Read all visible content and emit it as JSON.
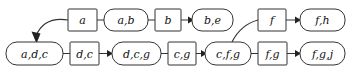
{
  "diagram": {
    "kind": "state-transition-graph",
    "colors": {
      "background": "#ffffff",
      "stroke": "#333333",
      "text": "#111111",
      "arrow": "#222222"
    },
    "nodes": [
      {
        "id": "a",
        "label": "a",
        "shape": "rectangle",
        "row": "top",
        "x": 68,
        "y": 9,
        "w": 29,
        "h": 22
      },
      {
        "id": "ab",
        "label": "a,b",
        "shape": "stadium",
        "row": "top",
        "x": 104,
        "y": 9,
        "w": 44,
        "h": 22
      },
      {
        "id": "b",
        "label": "b",
        "shape": "rectangle",
        "row": "top",
        "x": 155,
        "y": 9,
        "w": 26,
        "h": 22
      },
      {
        "id": "be",
        "label": "b,e",
        "shape": "stadium",
        "row": "top",
        "x": 192,
        "y": 9,
        "w": 41,
        "h": 22
      },
      {
        "id": "f",
        "label": "f",
        "shape": "rectangle",
        "row": "top",
        "x": 258,
        "y": 9,
        "w": 28,
        "h": 22
      },
      {
        "id": "fh",
        "label": "f,h",
        "shape": "stadium",
        "row": "top",
        "x": 300,
        "y": 9,
        "w": 45,
        "h": 22
      },
      {
        "id": "adc",
        "label": "a,d,c",
        "shape": "stadium",
        "row": "bottom",
        "x": 6,
        "y": 42,
        "w": 57,
        "h": 23
      },
      {
        "id": "dc",
        "label": "d,c",
        "shape": "rectangle",
        "row": "bottom",
        "x": 70,
        "y": 42,
        "w": 29,
        "h": 23
      },
      {
        "id": "dcg",
        "label": "d,c,g",
        "shape": "stadium",
        "row": "bottom",
        "x": 112,
        "y": 42,
        "w": 49,
        "h": 23
      },
      {
        "id": "cg",
        "label": "c,g",
        "shape": "rectangle",
        "row": "bottom",
        "x": 168,
        "y": 42,
        "w": 28,
        "h": 23
      },
      {
        "id": "cfg",
        "label": "c,f,g",
        "shape": "stadium",
        "row": "bottom",
        "x": 205,
        "y": 42,
        "w": 46,
        "h": 23
      },
      {
        "id": "fg",
        "label": "f,g",
        "shape": "rectangle",
        "row": "bottom",
        "x": 258,
        "y": 42,
        "w": 29,
        "h": 23
      },
      {
        "id": "fgj",
        "label": "f,g,j",
        "shape": "stadium",
        "row": "bottom",
        "x": 300,
        "y": 42,
        "w": 45,
        "h": 23
      }
    ],
    "edges": [
      {
        "id": "e-a-ab",
        "from": "a",
        "to": "ab",
        "style": "plain-line"
      },
      {
        "id": "e-ab-b",
        "from": "ab",
        "to": "b",
        "style": "plain-line"
      },
      {
        "id": "e-b-be",
        "from": "b",
        "to": "be",
        "style": "arrow"
      },
      {
        "id": "e-f-fh",
        "from": "f",
        "to": "fh",
        "style": "arrow"
      },
      {
        "id": "e-adc-dc",
        "from": "adc",
        "to": "dc",
        "style": "plain-line"
      },
      {
        "id": "e-dc-dcg",
        "from": "dc",
        "to": "dcg",
        "style": "arrow"
      },
      {
        "id": "e-dcg-cg",
        "from": "dcg",
        "to": "cg",
        "style": "plain-line"
      },
      {
        "id": "e-cg-cfg",
        "from": "cg",
        "to": "cfg",
        "style": "arrow"
      },
      {
        "id": "e-cfg-fg",
        "from": "cfg",
        "to": "fg",
        "style": "plain-line"
      },
      {
        "id": "e-fg-fgj",
        "from": "fg",
        "to": "fgj",
        "style": "arrow"
      },
      {
        "id": "e-a-adc",
        "from": "a",
        "to": "adc",
        "style": "curved-arrow-down-left"
      },
      {
        "id": "e-f-cfg",
        "from": "f",
        "to": "cfg",
        "style": "curved-line-down-left"
      }
    ]
  }
}
